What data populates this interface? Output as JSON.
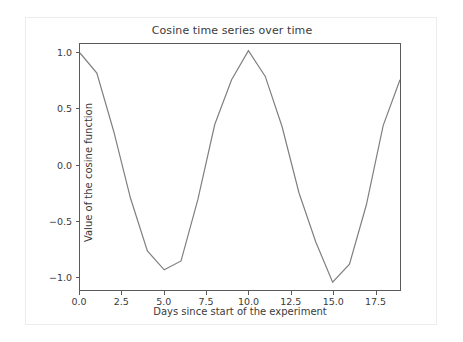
{
  "chart_data": {
    "type": "line",
    "title": "Cosine time series over time",
    "xlabel": "Days since start of the experiment",
    "ylabel": "Value of the cosine function",
    "xlim": [
      0,
      19
    ],
    "ylim": [
      -1.12,
      1.08
    ],
    "grid": false,
    "legend": null,
    "line_color": "#7f7f7f",
    "line_width": 1.2,
    "xticks": [
      "0.0",
      "2.5",
      "5.0",
      "7.5",
      "10.0",
      "12.5",
      "15.0",
      "17.5"
    ],
    "xtick_values": [
      0.0,
      2.5,
      5.0,
      7.5,
      10.0,
      12.5,
      15.0,
      17.5
    ],
    "yticks": [
      "1.0",
      "0.5",
      "0.0",
      "−0.5",
      "−1.0"
    ],
    "ytick_values": [
      1.0,
      0.5,
      0.0,
      -0.5,
      -1.0
    ],
    "x": [
      0,
      1,
      2,
      3,
      4,
      5,
      6,
      7,
      8,
      9,
      10,
      11,
      12,
      13,
      14,
      15,
      16,
      17,
      18,
      19
    ],
    "values": [
      1.0,
      0.82,
      0.3,
      -0.3,
      -0.77,
      -0.94,
      -0.86,
      -0.31,
      0.36,
      0.76,
      1.02,
      0.79,
      0.34,
      -0.25,
      -0.69,
      -1.05,
      -0.89,
      -0.36,
      0.35,
      0.76
    ],
    "series": [
      {
        "name": "cosine",
        "values": [
          1.0,
          0.82,
          0.3,
          -0.3,
          -0.77,
          -0.94,
          -0.86,
          -0.31,
          0.36,
          0.76,
          1.02,
          0.79,
          0.34,
          -0.25,
          -0.69,
          -1.05,
          -0.89,
          -0.36,
          0.35,
          0.76
        ]
      }
    ]
  },
  "figure": {
    "background": "#ffffff",
    "border_color": "#ececec",
    "axes_color": "#5a5a5a"
  }
}
